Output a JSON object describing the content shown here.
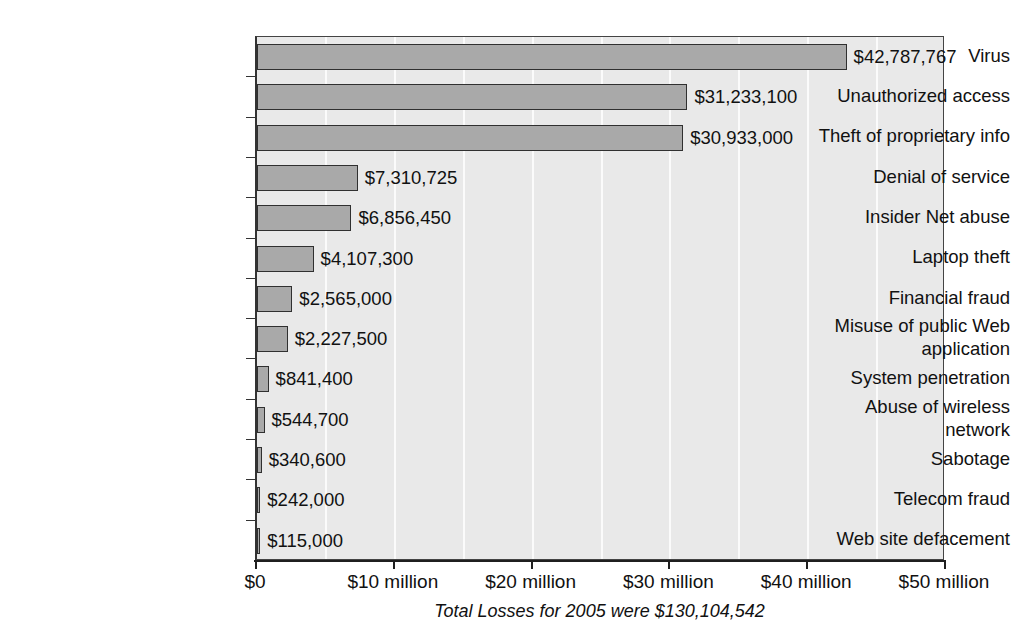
{
  "chart_data": {
    "type": "bar",
    "orientation": "horizontal",
    "title": "",
    "subtitle": "",
    "xlabel": "",
    "ylabel": "",
    "xlim": [
      0,
      50000000
    ],
    "grid": true,
    "legend": null,
    "categories": [
      "Virus",
      "Unauthorized access",
      "Theft of proprietary info",
      "Denial of service",
      "Insider Net abuse",
      "Laptop theft",
      "Financial fraud",
      "Misuse of public Web application",
      "System penetration",
      "Abuse of wireless network",
      "Sabotage",
      "Telecom fraud",
      "Web site defacement"
    ],
    "category_lines": [
      [
        "Virus"
      ],
      [
        "Unauthorized access"
      ],
      [
        "Theft of proprietary info"
      ],
      [
        "Denial of service"
      ],
      [
        "Insider Net abuse"
      ],
      [
        "Laptop theft"
      ],
      [
        "Financial fraud"
      ],
      [
        "Misuse of public Web",
        "application"
      ],
      [
        "System penetration"
      ],
      [
        "Abuse of wireless",
        "network"
      ],
      [
        "Sabotage"
      ],
      [
        "Telecom fraud"
      ],
      [
        "Web site defacement"
      ]
    ],
    "values": [
      42787767,
      31233100,
      30933000,
      7310725,
      6856450,
      4107300,
      2565000,
      2227500,
      841400,
      544700,
      340600,
      242000,
      115000
    ],
    "value_labels": [
      "$42,787,767",
      "$31,233,100",
      "$30,933,000",
      "$7,310,725",
      "$6,856,450",
      "$4,107,300",
      "$2,565,000",
      "$2,227,500",
      "$841,400",
      "$544,700",
      "$340,600",
      "$242,000",
      "$115,000"
    ],
    "xticks": [
      0,
      10000000,
      20000000,
      30000000,
      40000000,
      50000000
    ],
    "xtick_labels": [
      "$0",
      "$10 million",
      "$20 million",
      "$30 million",
      "$40 million",
      "$50 million"
    ],
    "gridline_values": [
      5000000,
      10000000,
      15000000,
      20000000,
      25000000,
      30000000,
      35000000,
      40000000,
      45000000
    ],
    "footer_note": "Total Losses for 2005 were $130,104,542",
    "colors": {
      "bar_fill": "#a9a9a9",
      "bar_border": "#303030",
      "plot_background": "#e9e9e9",
      "gridline": "#fbfbfb",
      "axis": "#1f1f1f",
      "text": "#111111",
      "page_background": "#ffffff"
    }
  }
}
